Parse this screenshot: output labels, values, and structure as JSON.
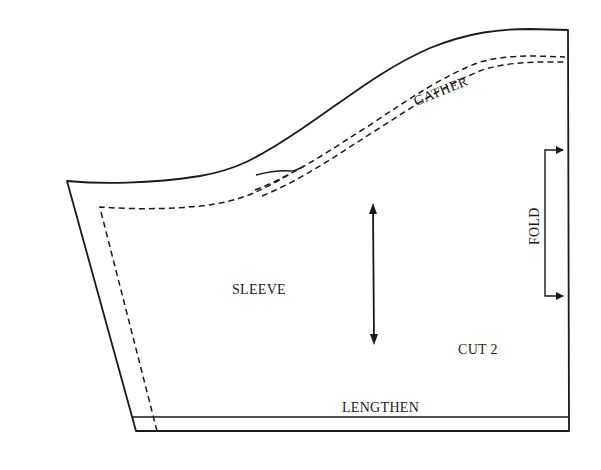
{
  "diagram": {
    "type": "sewing-pattern-piece",
    "piece_name": "SLEEVE",
    "labels": {
      "piece": "SLEEVE",
      "cut_instruction": "CUT 2",
      "gather": "GATHER",
      "fold": "FOLD",
      "lengthen": "LENGTHEN"
    },
    "markings": {
      "grainline_arrow": "double-headed vertical grainline",
      "fold_bracket": "place-on-fold bracket with arrows pointing to right edge",
      "gather_stitching": "double dashed gathering lines along sleeve cap",
      "seam_allowance": "dashed stitching line along left edge",
      "lengthen_line": "horizontal lengthen/shorten line near hem"
    },
    "colors": {
      "line": "#1a1a1a",
      "background": "#ffffff"
    }
  }
}
